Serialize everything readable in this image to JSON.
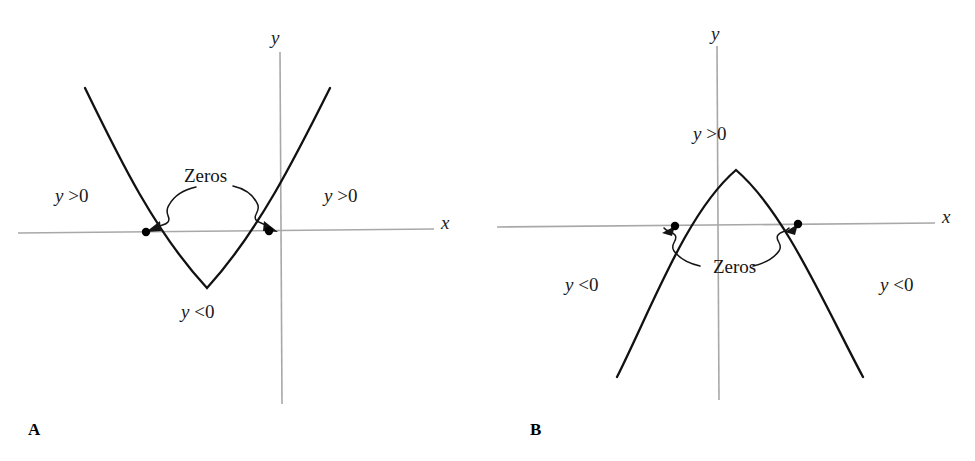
{
  "figure": {
    "width": 975,
    "height": 461,
    "background": "#ffffff",
    "curve_color": "#111111",
    "axis_color": "#a8a8a8",
    "point_color": "#000000"
  },
  "panels": [
    {
      "id": "A",
      "letter": "A",
      "parabola_direction": "opens-upward",
      "axis_x_label": "x",
      "axis_y_label": "y",
      "zeros_label": "Zeros",
      "region_left_label": "y >0",
      "region_right_label": "y >0",
      "region_middle_label": "y <0",
      "region_left_sign": "positive",
      "region_right_sign": "positive",
      "region_middle_sign": "negative"
    },
    {
      "id": "B",
      "letter": "B",
      "parabola_direction": "opens-downward",
      "axis_x_label": "x",
      "axis_y_label": "y",
      "zeros_label": "Zeros",
      "region_left_label": "y <0",
      "region_right_label": "y <0",
      "region_middle_label": "y >0",
      "region_left_sign": "negative",
      "region_right_sign": "negative",
      "region_middle_sign": "positive"
    }
  ],
  "chart_data": [
    {
      "type": "line",
      "title": "A",
      "xlabel": "x",
      "ylabel": "y",
      "grid": false,
      "legend": "none",
      "curve": "upward parabola",
      "xlim": [
        -3.4,
        2.1
      ],
      "ylim": [
        -1.3,
        2.6
      ],
      "zeros": [
        -1.1,
        -0.1
      ],
      "vertex": [
        -0.6,
        -0.55
      ],
      "annotations": [
        {
          "text": "Zeros",
          "x": -0.62,
          "y": 1.02,
          "points_to": [
            [
              -1.1,
              0
            ],
            [
              -0.1,
              0
            ]
          ]
        },
        {
          "text": "y >0",
          "x": -2.55,
          "y": 0.65
        },
        {
          "text": "y >0",
          "x": 0.45,
          "y": 0.65
        },
        {
          "text": "y <0",
          "x": -0.72,
          "y": -0.95
        }
      ],
      "x": [
        -2.42,
        -2.2,
        -2.0,
        -1.8,
        -1.6,
        -1.4,
        -1.2,
        -1.1,
        -1.0,
        -0.8,
        -0.6,
        -0.4,
        -0.2,
        -0.1,
        0.0,
        0.2,
        0.4,
        0.6,
        0.8,
        1.0
      ],
      "y": [
        2.66,
        2.0,
        1.47,
        1.0,
        0.61,
        0.29,
        0.04,
        -0.05,
        -0.16,
        -0.39,
        -0.55,
        -0.49,
        -0.2,
        -0.03,
        0.14,
        0.57,
        1.07,
        1.64,
        2.29,
        3.0
      ]
    },
    {
      "type": "line",
      "title": "B",
      "xlabel": "x",
      "ylabel": "y",
      "grid": false,
      "legend": "none",
      "curve": "downward parabola",
      "xlim": [
        -2.6,
        2.4
      ],
      "ylim": [
        -2.1,
        2.4
      ],
      "zeros": [
        -0.43,
        0.8
      ],
      "vertex": [
        0.18,
        0.55
      ],
      "annotations": [
        {
          "text": "Zeros",
          "x": 0.2,
          "y": -0.42,
          "points_to": [
            [
              -0.43,
              0
            ],
            [
              0.8,
              0
            ]
          ]
        },
        {
          "text": "y >0",
          "x": 0.0,
          "y": 0.95
        },
        {
          "text": "y <0",
          "x": -1.55,
          "y": -0.58
        },
        {
          "text": "y <0",
          "x": 1.72,
          "y": -0.58
        }
      ],
      "x": [
        -1.02,
        -0.9,
        -0.75,
        -0.6,
        -0.43,
        -0.3,
        -0.1,
        0.0,
        0.18,
        0.4,
        0.6,
        0.8,
        0.95,
        1.1,
        1.25,
        1.4
      ],
      "y": [
        -1.95,
        -1.52,
        -1.0,
        -0.52,
        0.0,
        0.28,
        0.5,
        0.54,
        0.55,
        0.45,
        0.27,
        0.0,
        -0.28,
        -0.67,
        -1.12,
        -1.62
      ]
    }
  ]
}
